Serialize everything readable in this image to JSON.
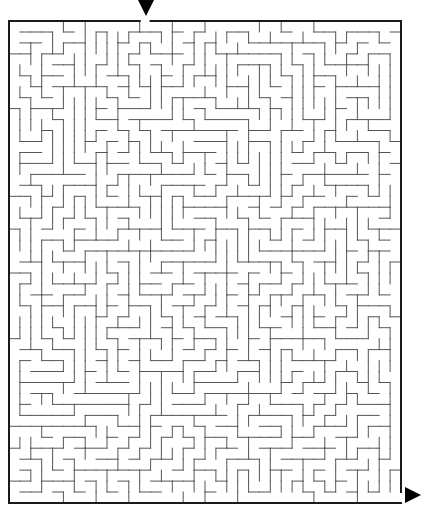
{
  "puzzle": {
    "type": "maze",
    "entrance": {
      "marker": "down-arrow",
      "x": 146,
      "y": 0
    },
    "exit": {
      "marker": "right-arrow",
      "x": 405,
      "y": 495
    },
    "frame": {
      "left": 9,
      "top": 21,
      "right": 401,
      "bottom": 503
    },
    "grid": {
      "cols": 36,
      "rows": 44,
      "seed": 1337
    },
    "colors": {
      "wall": "#555555",
      "border": "#1a1a1a",
      "arrow": "#000000",
      "background": "#ffffff"
    }
  }
}
